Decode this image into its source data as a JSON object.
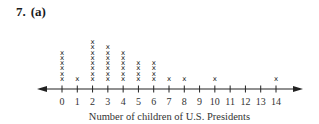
{
  "title": {
    "number": "7.",
    "part": "(a)"
  },
  "chart_data": {
    "type": "dot",
    "title": "",
    "xlabel": "Number of children of U.S. Presidents",
    "ylabel": "",
    "categories": [
      "0",
      "1",
      "2",
      "3",
      "4",
      "5",
      "6",
      "7",
      "8",
      "9",
      "10",
      "11",
      "12",
      "13",
      "14"
    ],
    "values": [
      6,
      1,
      8,
      7,
      6,
      4,
      4,
      1,
      1,
      0,
      1,
      0,
      0,
      0,
      1
    ],
    "marker": "x",
    "axis": {
      "min": 0,
      "max": 14,
      "step": 1,
      "arrows": "both"
    },
    "grid": false,
    "legend": null
  },
  "layout": {
    "axis_y": 89,
    "x0_px": 62,
    "x14_px": 276,
    "arrow_left_px": 37,
    "arrow_right_px": 303,
    "mark_base_y": 79,
    "mark_step_y": 5.3,
    "line_color": "#222222"
  }
}
